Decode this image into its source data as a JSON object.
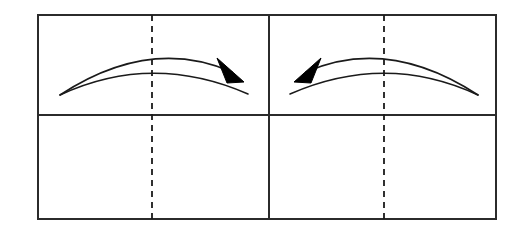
{
  "figure": {
    "background_color": "#ffffff",
    "stroke_color": "#1a1a1a",
    "border_color": "#2b2b2b",
    "dash_color": "#1a1a1a",
    "arrow_fill": "#000000",
    "canvas": {
      "width": 520,
      "height": 241
    }
  },
  "frame": {
    "name": "outer-rectangle",
    "x": 38,
    "y": 15,
    "width": 458,
    "height": 204,
    "stroke_width": 2
  },
  "dividers": {
    "vertical_center": {
      "name": "center-vertical-divider",
      "x": 269,
      "y1": 15,
      "y2": 219,
      "stroke_width": 2,
      "style": "solid"
    },
    "horizontal_middle": {
      "name": "middle-horizontal-divider",
      "y": 115,
      "x1": 38,
      "x2": 496,
      "stroke_width": 2,
      "style": "solid"
    }
  },
  "dashed_centerlines": [
    {
      "name": "left-dashed-centerline",
      "x": 152,
      "y1": 15,
      "y2": 219,
      "dash_pattern": "6 5",
      "stroke_width": 1.8
    },
    {
      "name": "right-dashed-centerline",
      "x": 384,
      "y1": 15,
      "y2": 219,
      "dash_pattern": "6 5",
      "stroke_width": 1.8
    }
  ],
  "cells": [
    {
      "name": "top-left-cell",
      "x": 38,
      "y": 15,
      "width": 231,
      "height": 100,
      "content": "rightward curved arrow pair"
    },
    {
      "name": "top-right-cell",
      "x": 269,
      "y": 15,
      "width": 227,
      "height": 100,
      "content": "leftward curved arrow pair"
    },
    {
      "name": "bottom-left-cell",
      "x": 38,
      "y": 115,
      "width": 231,
      "height": 104,
      "content": "empty"
    },
    {
      "name": "bottom-right-cell",
      "x": 269,
      "y": 115,
      "width": 227,
      "height": 104,
      "content": "empty"
    }
  ],
  "arrows": [
    {
      "name": "left-curved-arrow",
      "direction": "right",
      "panel": "top-left-cell",
      "upper_curve": {
        "name": "left-upper-curve",
        "start": [
          60,
          95
        ],
        "control": [
          150,
          36
        ],
        "end": [
          232,
          72
        ],
        "stroke_width": 1.6
      },
      "lower_curve": {
        "name": "left-lower-curve",
        "start": [
          60,
          95
        ],
        "control": [
          152,
          52
        ],
        "end": [
          248,
          94
        ],
        "stroke_width": 1.6
      },
      "arrowhead": {
        "name": "left-arrowhead",
        "points": "217,58 244,82 227,83",
        "fill": "#000000",
        "tip": [
          244,
          82
        ]
      }
    },
    {
      "name": "right-curved-arrow",
      "direction": "left",
      "panel": "top-right-cell",
      "upper_curve": {
        "name": "right-upper-curve",
        "start": [
          478,
          95
        ],
        "control": [
          388,
          36
        ],
        "end": [
          306,
          72
        ],
        "stroke_width": 1.6
      },
      "lower_curve": {
        "name": "right-lower-curve",
        "start": [
          478,
          95
        ],
        "control": [
          386,
          52
        ],
        "end": [
          290,
          94
        ],
        "stroke_width": 1.6
      },
      "arrowhead": {
        "name": "right-arrowhead",
        "points": "321,58 294,82 311,83",
        "fill": "#000000",
        "tip": [
          294,
          82
        ]
      }
    }
  ]
}
